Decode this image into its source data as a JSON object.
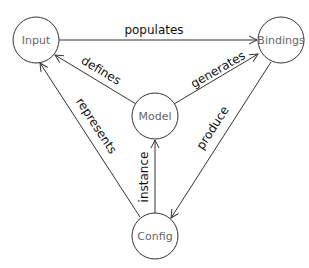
{
  "diagram": {
    "nodes": [
      {
        "id": "input",
        "label": "Input",
        "cx": 36,
        "cy": 40,
        "r": 23
      },
      {
        "id": "bindings",
        "label": "Bindings",
        "cx": 281,
        "cy": 40,
        "r": 23
      },
      {
        "id": "model",
        "label": "Model",
        "cx": 155,
        "cy": 116,
        "r": 23
      },
      {
        "id": "config",
        "label": "Config",
        "cx": 155,
        "cy": 236,
        "r": 23
      }
    ],
    "edges": [
      {
        "id": "populates",
        "from": "input",
        "to": "bindings",
        "label": "populates"
      },
      {
        "id": "defines",
        "from": "model",
        "to": "input",
        "label": "defines"
      },
      {
        "id": "generates",
        "from": "model",
        "to": "bindings",
        "label": "generates"
      },
      {
        "id": "represents",
        "from": "config",
        "to": "input",
        "label": "represents"
      },
      {
        "id": "instance",
        "from": "config",
        "to": "model",
        "label": "instance"
      },
      {
        "id": "produce",
        "from": "bindings",
        "to": "config",
        "label": "produce"
      }
    ],
    "colors": {
      "stroke": "#333333",
      "node_text": "#666666",
      "edge_text": "#111111",
      "background": "#ffffff"
    }
  }
}
